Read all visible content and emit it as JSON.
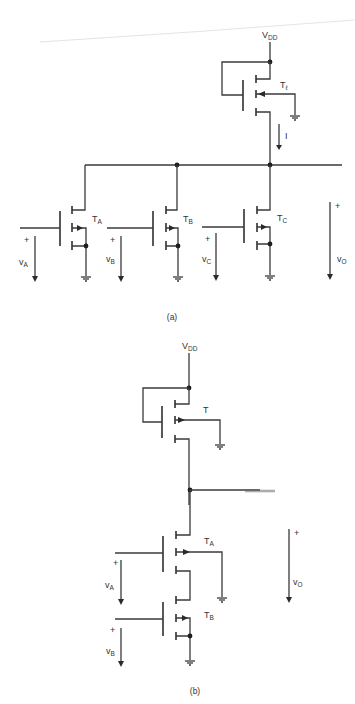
{
  "figure": {
    "colors": {
      "ink": "#333333",
      "background": "#ffffff"
    },
    "part_a": {
      "caption": "(a)",
      "supply": {
        "label": "V",
        "sub": "DD"
      },
      "load_transistor": {
        "label": "T",
        "sub": "ℓ"
      },
      "current_label": "I",
      "transistors": [
        {
          "label": "T",
          "sub": "A",
          "input": {
            "plus": "+",
            "label": "v",
            "sub": "A"
          }
        },
        {
          "label": "T",
          "sub": "B",
          "input": {
            "plus": "+",
            "label": "v",
            "sub": "B"
          }
        },
        {
          "label": "T",
          "sub": "C",
          "input": {
            "plus": "+",
            "label": "v",
            "sub": "C"
          }
        }
      ],
      "output": {
        "plus": "+",
        "label": "v",
        "sub": "O"
      }
    },
    "part_b": {
      "caption": "(b)",
      "supply": {
        "label": "V",
        "sub": "DD"
      },
      "load_transistor": {
        "label": "T",
        "sub": ""
      },
      "transistors": [
        {
          "label": "T",
          "sub": "A",
          "input": {
            "plus": "+",
            "label": "v",
            "sub": "A"
          }
        },
        {
          "label": "T",
          "sub": "B",
          "input": {
            "plus": "+",
            "label": "v",
            "sub": "B"
          }
        }
      ],
      "output": {
        "plus": "+",
        "label": "v",
        "sub": "O"
      }
    }
  }
}
